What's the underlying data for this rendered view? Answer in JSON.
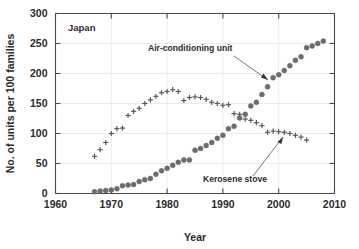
{
  "figure": {
    "panel_label": "Japan",
    "background": "#ffffff",
    "marker_color": "#6d6d6d",
    "axis_color": "#4a4a4a"
  },
  "axes": {
    "x_title": "Year",
    "y_title": "No. of units per 100 families",
    "x_ticks": [
      "1960",
      "1970",
      "1980",
      "1990",
      "2000",
      "2010"
    ],
    "y_ticks": [
      "0",
      "50",
      "100",
      "150",
      "200",
      "250",
      "300"
    ]
  },
  "annotations": [
    {
      "name": "air-conditioning-unit",
      "text": "Air-conditioning unit"
    },
    {
      "name": "kerosene-stove",
      "text": "Kerosene stove"
    }
  ],
  "chart_data": {
    "type": "scatter",
    "title": "",
    "subtitle": "Japan",
    "xlabel": "Year",
    "ylabel": "No. of units per 100 families",
    "xlim": [
      1960,
      2010
    ],
    "ylim": [
      0,
      300
    ],
    "xticks": [
      1960,
      1970,
      1980,
      1990,
      2000,
      2010
    ],
    "yticks": [
      0,
      50,
      100,
      150,
      200,
      250,
      300
    ],
    "grid": true,
    "legend": "annotated-inline",
    "series": [
      {
        "name": "Air-conditioning unit",
        "marker": "filled-circle",
        "color": "#6d6d6d",
        "x": [
          1967,
          1968,
          1969,
          1970,
          1971,
          1972,
          1973,
          1974,
          1975,
          1976,
          1977,
          1978,
          1979,
          1980,
          1981,
          1982,
          1983,
          1984,
          1985,
          1986,
          1987,
          1988,
          1989,
          1990,
          1991,
          1992,
          1993,
          1994,
          1995,
          1996,
          1997,
          1998,
          1999,
          2000,
          2001,
          2002,
          2003,
          2004,
          2005,
          2006,
          2007,
          2008
        ],
        "y": [
          3,
          4,
          5,
          6,
          8,
          13,
          14,
          15,
          20,
          23,
          25,
          32,
          38,
          42,
          47,
          52,
          56,
          56,
          72,
          75,
          80,
          85,
          92,
          97,
          108,
          112,
          126,
          132,
          146,
          152,
          165,
          178,
          193,
          198,
          205,
          213,
          222,
          228,
          243,
          246,
          250,
          254
        ]
      },
      {
        "name": "Kerosene stove",
        "marker": "plus",
        "color": "#555555",
        "x": [
          1967,
          1968,
          1969,
          1970,
          1971,
          1972,
          1973,
          1974,
          1975,
          1976,
          1977,
          1978,
          1979,
          1980,
          1981,
          1982,
          1983,
          1984,
          1985,
          1986,
          1987,
          1988,
          1989,
          1990,
          1991,
          1992,
          1993,
          1994,
          1995,
          1996,
          1997,
          1998,
          1999,
          2000,
          2001,
          2002,
          2003,
          2004,
          2005
        ],
        "y": [
          62,
          73,
          85,
          100,
          108,
          109,
          130,
          137,
          142,
          150,
          156,
          162,
          168,
          170,
          173,
          170,
          155,
          160,
          161,
          160,
          157,
          152,
          150,
          147,
          148,
          133,
          132,
          124,
          122,
          118,
          113,
          102,
          104,
          103,
          102,
          100,
          97,
          94,
          89
        ]
      }
    ]
  }
}
